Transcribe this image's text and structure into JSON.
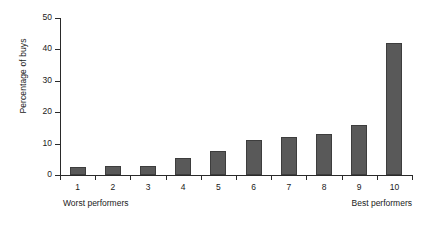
{
  "chart_data": {
    "type": "bar",
    "title": "",
    "subtitle": "",
    "xlabel": "",
    "ylabel": "Percentage of buys",
    "categories": [
      "1",
      "2",
      "3",
      "4",
      "5",
      "6",
      "7",
      "8",
      "9",
      "10"
    ],
    "values": [
      2.5,
      3,
      3,
      5.5,
      7.5,
      11,
      12,
      13,
      16,
      42
    ],
    "series": [
      {
        "name": "Percentage of buys",
        "values": [
          2.5,
          3,
          3,
          5.5,
          7.5,
          11,
          12,
          13,
          16,
          42
        ]
      }
    ],
    "ylim": [
      0,
      50
    ],
    "yticks": [
      0,
      10,
      20,
      30,
      40,
      50
    ],
    "ytick_labels": [
      "0",
      "10",
      "20",
      "30",
      "40",
      "50"
    ],
    "xtick_labels": [
      "1",
      "2",
      "3",
      "4",
      "5",
      "6",
      "7",
      "8",
      "9",
      "10"
    ],
    "grid": false,
    "legend": false,
    "legend_position": "none",
    "bar_color": "#595959",
    "bar_edge_color": "#3d3d3d",
    "axis_color": "#2a2a2a",
    "background_color": "#ffffff",
    "annotations": [
      {
        "text": "Worst performers",
        "position": "bottom-left"
      },
      {
        "text": "Best performers",
        "position": "bottom-right"
      }
    ]
  },
  "notes": {
    "left": "Worst performers",
    "right": "Best performers"
  }
}
